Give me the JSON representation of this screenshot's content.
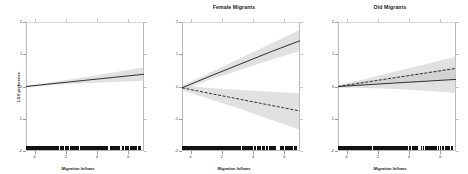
{
  "figure": {
    "background": "#ffffff",
    "band_color": "#c9c9c9",
    "line_color": "#1c1c1c"
  },
  "chart_data": [
    {
      "type": "line",
      "title": "",
      "xlabel": "Migration Inflows",
      "ylabel": "LGV preference",
      "xlim": [
        -0.55,
        7.0
      ],
      "ylim": [
        -2.0,
        2.0
      ],
      "xticks": [
        0,
        2,
        4,
        6
      ],
      "yticks": [
        -2,
        -1,
        0,
        1,
        2
      ],
      "grid": false,
      "legend": "none",
      "rug": true,
      "series": [
        {
          "name": "All Migrants",
          "style": "solid",
          "x": [
            -0.55,
            1.3,
            3.2,
            5.1,
            7.0
          ],
          "y": [
            0.0,
            0.095,
            0.19,
            0.285,
            0.38
          ],
          "ci_low": [
            -0.03,
            0.05,
            0.1,
            0.14,
            0.18
          ],
          "ci_high": [
            0.03,
            0.15,
            0.29,
            0.44,
            0.6
          ]
        }
      ]
    },
    {
      "type": "line",
      "title": "Female Migrants",
      "xlabel": "Migration Inflows",
      "ylabel": "",
      "xlim": [
        -0.55,
        7.0
      ],
      "ylim": [
        -2.0,
        2.0
      ],
      "xticks": [
        0,
        2,
        4,
        6
      ],
      "yticks": [
        -2,
        -1,
        0,
        1,
        2
      ],
      "grid": false,
      "legend": "none",
      "rug": true,
      "series": [
        {
          "name": "Female Migrants (positive)",
          "style": "solid",
          "x": [
            -0.55,
            1.3,
            3.2,
            5.1,
            7.0
          ],
          "y": [
            -0.04,
            0.33,
            0.7,
            1.07,
            1.42
          ],
          "ci_low": [
            -0.1,
            0.22,
            0.52,
            0.82,
            1.1
          ],
          "ci_high": [
            0.02,
            0.44,
            0.88,
            1.32,
            1.76
          ]
        },
        {
          "name": "Female Migrants (negative)",
          "style": "dashed",
          "x": [
            -0.55,
            1.3,
            3.2,
            5.1,
            7.0
          ],
          "y": [
            -0.04,
            -0.22,
            -0.4,
            -0.58,
            -0.76
          ],
          "ci_low": [
            -0.11,
            -0.4,
            -0.7,
            -1.02,
            -1.34
          ],
          "ci_high": [
            0.03,
            -0.05,
            -0.11,
            -0.16,
            -0.21
          ]
        }
      ]
    },
    {
      "type": "line",
      "title": "Old Migrants",
      "xlabel": "Migration Inflows",
      "ylabel": "",
      "xlim": [
        -0.55,
        7.0
      ],
      "ylim": [
        -2.0,
        2.0
      ],
      "xticks": [
        0,
        2,
        4,
        6
      ],
      "yticks": [
        -2,
        -1,
        0,
        1,
        2
      ],
      "grid": false,
      "legend": "none",
      "rug": true,
      "series": [
        {
          "name": "Old Migrants (upper)",
          "style": "dashed",
          "x": [
            -0.55,
            1.3,
            3.2,
            5.1,
            7.0
          ],
          "y": [
            0.0,
            0.14,
            0.28,
            0.42,
            0.56
          ],
          "ci_low": [
            -0.03,
            0.04,
            0.11,
            0.16,
            0.21
          ],
          "ci_high": [
            0.03,
            0.25,
            0.47,
            0.7,
            0.93
          ]
        },
        {
          "name": "Old Migrants (lower)",
          "style": "solid",
          "x": [
            -0.55,
            1.3,
            3.2,
            5.1,
            7.0
          ],
          "y": [
            0.0,
            0.055,
            0.11,
            0.165,
            0.22
          ],
          "ci_low": [
            -0.04,
            -0.05,
            -0.08,
            -0.13,
            -0.2
          ],
          "ci_high": [
            0.04,
            0.17,
            0.31,
            0.46,
            0.62
          ]
        }
      ]
    }
  ]
}
